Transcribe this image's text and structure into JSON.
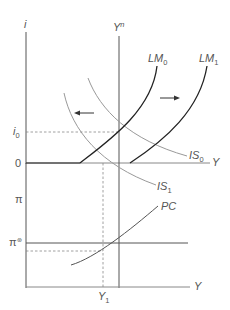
{
  "diagram": {
    "top_panel": {
      "y_axis_label": "i",
      "x_axis_label": "Y",
      "tick_i0": "i",
      "tick_i0_sub": "0",
      "tick_zero": "0",
      "curves": [
        {
          "name": "LM",
          "sub": "0"
        },
        {
          "name": "LM",
          "sub": "1"
        },
        {
          "name": "IS",
          "sub": "0"
        },
        {
          "name": "IS",
          "sub": "1"
        }
      ],
      "vertical_label": "Y",
      "vertical_label_sup": "n"
    },
    "bottom_panel": {
      "y_axis_label": "π",
      "x_axis_label": "Y",
      "tick_target": "π",
      "tick_target_sup": "⊛",
      "curve_label": "PC",
      "tick_y1": "Y",
      "tick_y1_sub": "1"
    },
    "colors": {
      "axis": "#444444",
      "lm_curve": "#222222",
      "is_curve": "#999999",
      "guide": "#777777"
    }
  }
}
